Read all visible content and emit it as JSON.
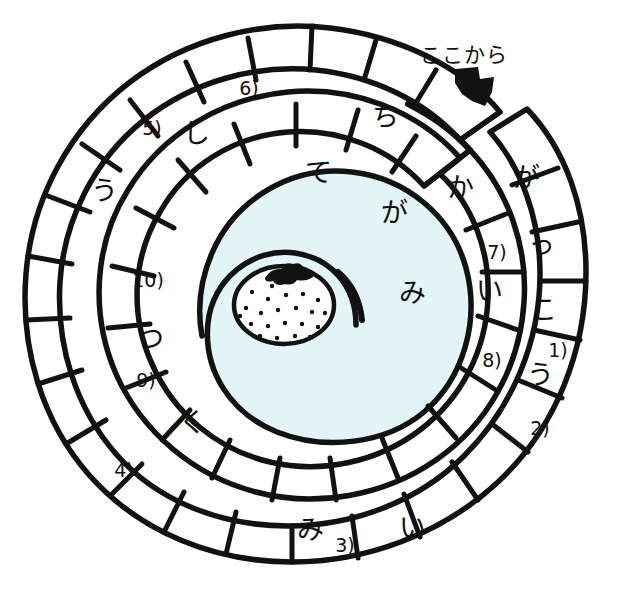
{
  "worksheet": {
    "type": "hiragana-spiral-word-puzzle",
    "caption": "ここから",
    "arrow_icon": "down-arrow-icon",
    "center_icon": "strawberry-icon",
    "colors": {
      "ink": "#121212",
      "paper": "#ffffff",
      "center_fill": "#e3f4f7"
    }
  },
  "spiral": {
    "start_label": "ここから",
    "cells": [
      {
        "id": "c01",
        "ring": "outer",
        "text": "が",
        "kind": "glyph",
        "x": 526,
        "y": 177
      },
      {
        "id": "c02",
        "ring": "outer",
        "text": "っ",
        "kind": "glyph",
        "x": 541,
        "y": 244
      },
      {
        "id": "c03",
        "ring": "outer",
        "text": "こ",
        "kind": "glyph",
        "x": 543,
        "y": 309
      },
      {
        "id": "c04",
        "ring": "outer",
        "text": "1)",
        "kind": "number",
        "x": 558,
        "y": 350
      },
      {
        "id": "c05",
        "ring": "outer",
        "text": "う",
        "kind": "glyph",
        "x": 540,
        "y": 374
      },
      {
        "id": "c06",
        "ring": "outer",
        "text": "2)",
        "kind": "number",
        "x": 540,
        "y": 428
      },
      {
        "id": "c07",
        "ring": "outer",
        "text": "",
        "kind": "blank",
        "x": 500,
        "y": 478
      },
      {
        "id": "c08",
        "ring": "outer",
        "text": "い",
        "kind": "glyph",
        "x": 412,
        "y": 527
      },
      {
        "id": "c09",
        "ring": "outer",
        "text": "3)",
        "kind": "number",
        "x": 345,
        "y": 545
      },
      {
        "id": "c10",
        "ring": "outer",
        "text": "み",
        "kind": "glyph",
        "x": 310,
        "y": 529
      },
      {
        "id": "c11",
        "ring": "outer",
        "text": "",
        "kind": "blank",
        "x": 222,
        "y": 518
      },
      {
        "id": "c12",
        "ring": "outer",
        "text": "4)",
        "kind": "number",
        "x": 124,
        "y": 470
      },
      {
        "id": "c13",
        "ring": "outer",
        "text": "",
        "kind": "blank",
        "x": 82,
        "y": 400
      },
      {
        "id": "c14",
        "ring": "outer",
        "text": "",
        "kind": "blank",
        "x": 70,
        "y": 322
      },
      {
        "id": "c15",
        "ring": "outer",
        "text": "う",
        "kind": "glyph",
        "x": 104,
        "y": 190
      },
      {
        "id": "c16",
        "ring": "outer",
        "text": "5)",
        "kind": "number",
        "x": 152,
        "y": 128
      },
      {
        "id": "c17",
        "ring": "outer",
        "text": "し",
        "kind": "glyph",
        "x": 196,
        "y": 133
      },
      {
        "id": "c18",
        "ring": "outer",
        "text": "6)",
        "kind": "number",
        "x": 249,
        "y": 88
      },
      {
        "id": "c19",
        "ring": "outer",
        "text": "",
        "kind": "blank",
        "x": 315,
        "y": 80
      },
      {
        "id": "c20",
        "ring": "outer",
        "text": "ち",
        "kind": "glyph",
        "x": 385,
        "y": 116
      },
      {
        "id": "c21",
        "ring": "outer",
        "text": "か",
        "kind": "glyph",
        "x": 460,
        "y": 187
      },
      {
        "id": "c22",
        "ring": "inner",
        "text": "7)",
        "kind": "number",
        "x": 497,
        "y": 252
      },
      {
        "id": "c23",
        "ring": "inner",
        "text": "い",
        "kind": "glyph",
        "x": 489,
        "y": 290
      },
      {
        "id": "c24",
        "ring": "inner",
        "text": "8)",
        "kind": "number",
        "x": 492,
        "y": 360
      },
      {
        "id": "c25",
        "ring": "inner",
        "text": "",
        "kind": "blank",
        "x": 430,
        "y": 430
      },
      {
        "id": "c26",
        "ring": "inner",
        "text": "",
        "kind": "blank",
        "x": 330,
        "y": 455
      },
      {
        "id": "c27",
        "ring": "inner",
        "text": "",
        "kind": "blank",
        "x": 255,
        "y": 430
      },
      {
        "id": "c28",
        "ring": "inner",
        "text": "く",
        "kind": "glyph",
        "x": 192,
        "y": 422
      },
      {
        "id": "c29",
        "ring": "inner",
        "text": "9)",
        "kind": "number",
        "x": 146,
        "y": 380
      },
      {
        "id": "c30",
        "ring": "inner",
        "text": "つ",
        "kind": "glyph",
        "x": 150,
        "y": 338
      },
      {
        "id": "c31",
        "ring": "inner",
        "text": "10)",
        "kind": "number",
        "x": 148,
        "y": 280
      },
      {
        "id": "c32",
        "ring": "inner",
        "text": "",
        "kind": "blank",
        "x": 186,
        "y": 215
      },
      {
        "id": "c33",
        "ring": "inner",
        "text": "",
        "kind": "blank",
        "x": 250,
        "y": 168
      },
      {
        "id": "c34",
        "ring": "inner",
        "text": "て",
        "kind": "glyph",
        "x": 318,
        "y": 172
      },
      {
        "id": "c35",
        "ring": "inner",
        "text": "が",
        "kind": "glyph",
        "x": 394,
        "y": 212
      },
      {
        "id": "c36",
        "ring": "inner",
        "text": "み",
        "kind": "glyph",
        "x": 412,
        "y": 292
      }
    ]
  }
}
